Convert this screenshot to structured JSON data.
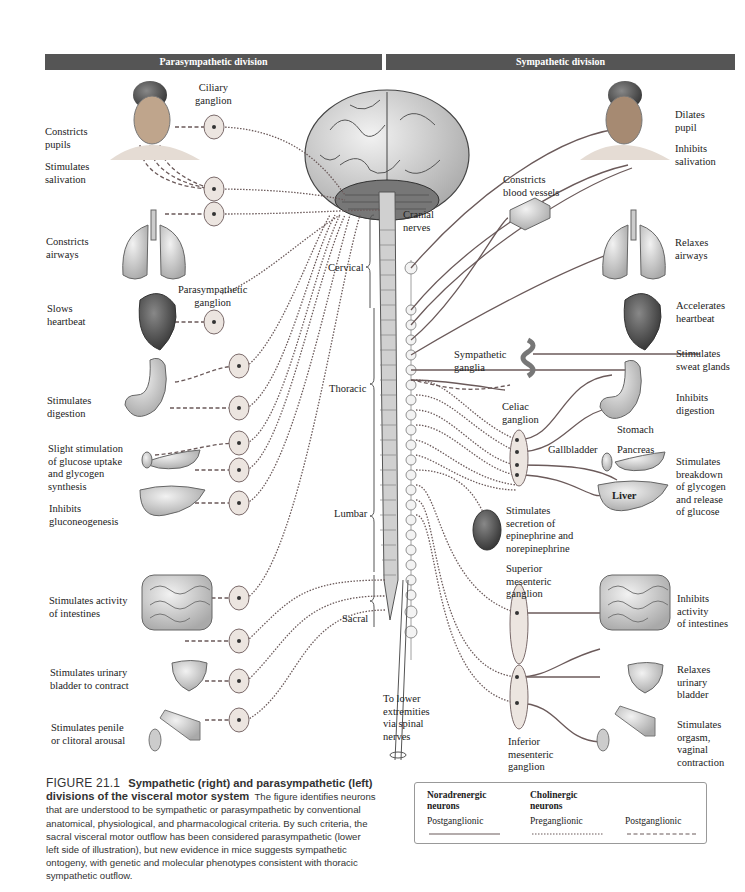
{
  "headers": {
    "left": "Parasympathetic division",
    "right": "Sympathetic division"
  },
  "parasympathetic": {
    "ganglion_labels": {
      "ciliary": "Ciliary\nganglion",
      "parasympathetic": "Parasympathetic\nganglion"
    },
    "effects": [
      "Constricts\npupils",
      "Stimulates\nsalivation",
      "Constricts\nairways",
      "Slows\nheartbeat",
      "Stimulates\ndigestion",
      "Slight stimulation\nof glucose uptake\nand glycogen\nsynthesis",
      "Inhibits\ngluconeogenesis",
      "Stimulates activity\nof intestines",
      "Stimulates urinary\nbladder to contract",
      "Stimulates penile\nor clitoral arousal"
    ]
  },
  "cns": {
    "cranial": "Cranial\nnerves",
    "regions": [
      "Cervical",
      "Thoracic",
      "Lumbar",
      "Sacral"
    ],
    "lower": "To lower\nextremities\nvia spinal\nnerves"
  },
  "sympathetic": {
    "ganglion_labels": {
      "sympathetic": "Sympathetic\nganglia",
      "celiac": "Celiac\nganglion",
      "superior_mesenteric": "Superior\nmesenteric\nganglion",
      "inferior_mesenteric": "Inferior\nmesenteric\nganglion"
    },
    "organ_labels": {
      "stomach": "Stomach",
      "gallbladder": "Gallbladder",
      "pancreas": "Pancreas",
      "liver": "Liver"
    },
    "effects": [
      "Dilates\npupil",
      "Inhibits\nsalivation",
      "Constricts\nblood vessels",
      "Relaxes\nairways",
      "Accelerates\nheartbeat",
      "Stimulates\nsweat glands",
      "Inhibits\ndigestion",
      "Stimulates\nbreakdown\nof glycogen\nand release\nof glucose",
      "Stimulates\nsecretion of\nepinephrine and\nnorepinephrine",
      "Inhibits\nactivity\nof intestines",
      "Relaxes\nurinary\nbladder",
      "Stimulates\norgasm,\nvaginal\ncontraction"
    ]
  },
  "caption": {
    "figure": "FIGURE 21.1",
    "title": "Sympathetic (right) and parasympathetic (left) divisions of the visceral motor system",
    "body": "The figure identifies neurons that are understood to be sympathetic or parasympathetic by conventional anatomical, physiological, and pharmacological criteria. By such criteria, the sacral visceral motor outflow has been considered parasympathetic (lower left side of illustration), but new evidence in mice suggests sympathetic ontogeny, with genetic and molecular phenotypes consistent with thoracic sympathetic outflow."
  },
  "legend": {
    "groups": [
      {
        "title": "Noradrenergic\nneurons",
        "items": [
          "Postganglionic"
        ]
      },
      {
        "title": "Cholinergic\nneurons",
        "items": [
          "Preganglionic",
          "Postganglionic"
        ]
      }
    ]
  },
  "colors": {
    "header_bg": "#555555",
    "nerve_line": "#6b5a5a",
    "ganglion_fill": "#ece5e0",
    "organ_fill": "#d8d8d8"
  }
}
